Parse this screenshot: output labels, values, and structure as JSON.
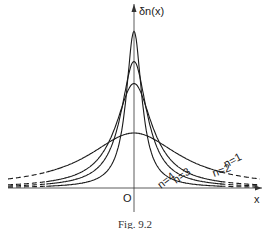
{
  "chart_data": {
    "type": "line",
    "title": "",
    "ylabel": "δn(x)",
    "xlabel": "x",
    "origin_label": "O",
    "caption": "Fig. 9.2",
    "x_range": [
      -3.5,
      3.5
    ],
    "series": [
      {
        "name": "n=1",
        "label": "n=1",
        "n": 1,
        "peak": 1.0
      },
      {
        "name": "n=2",
        "label": "n=2",
        "n": 2,
        "peak": 1.9
      },
      {
        "name": "n=3",
        "label": "n=3",
        "n": 3,
        "peak": 2.3
      },
      {
        "name": "n=4",
        "label": "n=4",
        "n": 4,
        "peak": 2.85
      }
    ],
    "function_family": "peaked curves, dashed tails at large |x|"
  }
}
